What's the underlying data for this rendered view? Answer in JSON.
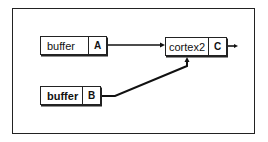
{
  "nodes": [
    {
      "id": "buffer-a",
      "label": "buffer",
      "port": "A"
    },
    {
      "id": "cortex2",
      "label": "cortex2",
      "port": "C"
    },
    {
      "id": "buffer-b",
      "label": "buffer",
      "port": "B"
    }
  ],
  "edges": [
    {
      "from": "A",
      "to": "cortex2"
    },
    {
      "from": "B",
      "to": "cortex2"
    },
    {
      "from": "C",
      "to": "output"
    }
  ]
}
